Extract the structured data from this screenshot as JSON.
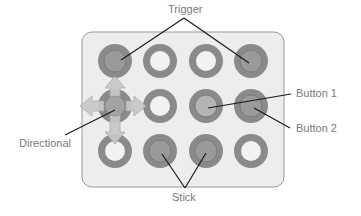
{
  "labels": {
    "trigger": "Trigger",
    "button1": "Button 1",
    "button2": "Button 2",
    "directional": "Directional",
    "stick": "Stick"
  },
  "colors": {
    "board_fill": "#ededed",
    "board_stroke": "#9a9a9a",
    "ring": "#8a8a8a",
    "ring_dark": "#7b7b7b",
    "inner_hollow": "#f2f2f2",
    "inner_filled": "#9a9a9a",
    "inner_button1": "#b4b4b4",
    "arrow_fill": "#c8c8c8",
    "arrow_stroke": "#a8a8a8",
    "leader_line": "#1a1a1a",
    "label_text": "#7a7a7a"
  },
  "board": {
    "rows": 3,
    "cols": 4,
    "cells": [
      [
        "trigger",
        "hollow",
        "hollow",
        "trigger"
      ],
      [
        "directional",
        "hollow",
        "button1",
        "button2"
      ],
      [
        "hollow",
        "stick",
        "stick",
        "hollow"
      ]
    ]
  }
}
